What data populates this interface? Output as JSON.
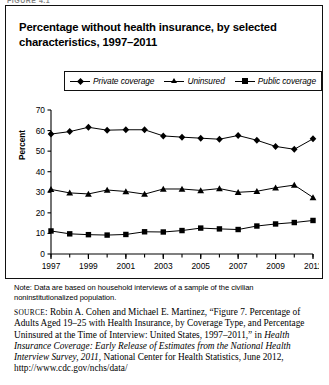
{
  "figure_label": "FIGURE 4.1",
  "title": "Percentage without health insurance, by selected characteristics, 1997–2011",
  "legend": {
    "items": [
      {
        "label": "Private coverage",
        "marker": "diamond-marker-icon"
      },
      {
        "label": "Uninsured",
        "marker": "triangle-marker-icon"
      },
      {
        "label": "Public coverage",
        "marker": "square-marker-icon"
      }
    ]
  },
  "note": "Note: Data are based on household interviews of a sample of the civilian noninstitutionalized population.",
  "source": {
    "prefix": "SOURCE",
    "part1": ": Robin A. Cohen and Michael E. Martinez, “Figure 7. Percentage of Adults Aged 19–25 with Health Insurance, by Coverage Type, and Percentage Uninsured at the Time of Interview: United States, 1997–2011,” in ",
    "italic1": "Health Insurance Coverage: Early Release of Estimates from the National Health Interview Survey, 2011",
    "part2": ", National Center for Health Statistics, June 2012, http://www.cdc.gov/nchs/data/"
  },
  "chart_data": {
    "type": "line",
    "title": "Percentage without health insurance, by selected characteristics, 1997–2011",
    "xlabel": "",
    "ylabel": "Percent",
    "ylim": [
      0,
      70
    ],
    "yticks": [
      0,
      10,
      20,
      30,
      40,
      50,
      60,
      70
    ],
    "grid": false,
    "legend_position": "top",
    "x": [
      1997,
      1998,
      1999,
      2000,
      2001,
      2002,
      2003,
      2004,
      2005,
      2006,
      2007,
      2008,
      2009,
      2010,
      2011
    ],
    "xticks": [
      1997,
      1999,
      2001,
      2003,
      2005,
      2007,
      2009,
      2011
    ],
    "xtick_labels": [
      "1997",
      "1999",
      "2001",
      "2003",
      "2005",
      "2007",
      "2009",
      "2011"
    ],
    "series": [
      {
        "name": "Private coverage",
        "marker": "diamond",
        "values": [
          58.3,
          59.5,
          61.6,
          60.2,
          60.4,
          60.4,
          57.4,
          56.8,
          56.3,
          55.8,
          57.6,
          55.3,
          52.3,
          50.9,
          56.0
        ]
      },
      {
        "name": "Uninsured",
        "marker": "triangle",
        "values": [
          31.4,
          29.7,
          29.2,
          31.1,
          30.4,
          29.1,
          31.6,
          31.6,
          30.9,
          31.8,
          30.0,
          30.5,
          32.2,
          33.5,
          27.5
        ]
      },
      {
        "name": "Public coverage",
        "marker": "square",
        "values": [
          11.2,
          9.8,
          9.4,
          9.2,
          9.5,
          10.8,
          10.7,
          11.4,
          12.6,
          12.2,
          11.9,
          13.6,
          14.6,
          15.3,
          16.3
        ]
      }
    ]
  }
}
